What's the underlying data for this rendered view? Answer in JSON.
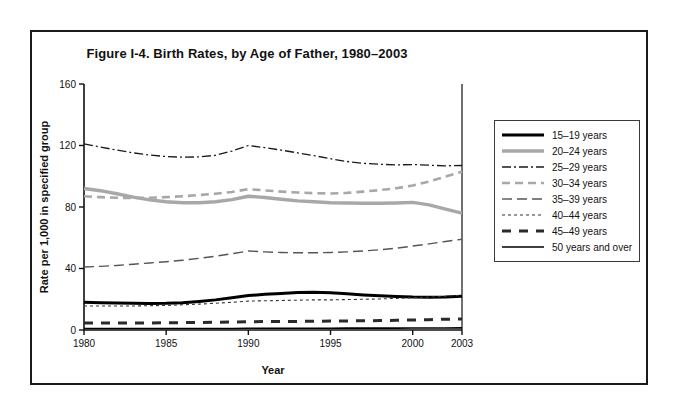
{
  "figure": {
    "title": "Figure I-4. Birth Rates, by Age of Father, 1980–2003"
  },
  "chart_data": {
    "type": "line",
    "title": "Figure I-4. Birth Rates, by Age of Father, 1980–2003",
    "xlabel": "Year",
    "ylabel": "Rate per 1,000 in specified group",
    "xlim": [
      1980,
      2003
    ],
    "ylim": [
      0,
      160
    ],
    "ytick_values": [
      0,
      40,
      80,
      120,
      160
    ],
    "ytick_labels": [
      "0",
      "40",
      "80",
      "120",
      "160"
    ],
    "xtick_values": [
      1980,
      1985,
      1990,
      1995,
      2000,
      2003
    ],
    "xtick_labels": [
      "1980",
      "1985",
      "1990",
      "1995",
      "2000",
      "2003"
    ],
    "grid": false,
    "legend_position": "right-outside",
    "x": [
      1980,
      1981,
      1982,
      1983,
      1984,
      1985,
      1986,
      1987,
      1988,
      1989,
      1990,
      1991,
      1992,
      1993,
      1994,
      1995,
      1996,
      1997,
      1998,
      1999,
      2000,
      2001,
      2002,
      2003
    ],
    "series": [
      {
        "name": "15–19 years",
        "style": "solid-thick",
        "color": "#000000",
        "values": [
          18.0,
          17.8,
          17.6,
          17.4,
          17.3,
          17.4,
          17.8,
          18.6,
          19.6,
          21.0,
          22.4,
          23.2,
          23.8,
          24.4,
          24.6,
          24.3,
          23.6,
          22.8,
          22.2,
          21.8,
          21.4,
          21.3,
          21.5,
          22.0
        ]
      },
      {
        "name": "20–24 years",
        "style": "solid-thick-gray",
        "color": "#a8a8a8",
        "values": [
          92.0,
          90.6,
          88.6,
          86.4,
          84.6,
          83.4,
          82.8,
          82.8,
          83.4,
          84.8,
          87.0,
          86.2,
          85.0,
          84.0,
          83.4,
          82.8,
          82.6,
          82.4,
          82.4,
          82.6,
          83.0,
          81.4,
          78.6,
          76.0
        ]
      },
      {
        "name": "25–29 years",
        "style": "dashdot",
        "color": "#1a1a1a",
        "values": [
          121.0,
          119.0,
          117.0,
          115.2,
          113.8,
          112.8,
          112.4,
          112.6,
          113.6,
          116.4,
          120.0,
          118.6,
          117.0,
          115.2,
          113.4,
          111.4,
          109.6,
          108.4,
          107.8,
          107.4,
          107.6,
          107.2,
          106.8,
          107.0
        ]
      },
      {
        "name": "30–34 years",
        "style": "dashed-medium-gray",
        "color": "#a8a8a8",
        "values": [
          87.0,
          86.4,
          86.0,
          85.8,
          86.0,
          86.4,
          87.0,
          87.8,
          88.6,
          89.8,
          91.6,
          90.8,
          90.0,
          89.4,
          89.0,
          88.8,
          89.2,
          90.0,
          91.0,
          92.2,
          94.0,
          96.6,
          99.8,
          103.0
        ]
      },
      {
        "name": "35–39 years",
        "style": "dashed-long",
        "color": "#555555",
        "values": [
          41.0,
          41.4,
          42.0,
          42.8,
          43.6,
          44.4,
          45.4,
          46.6,
          48.0,
          49.6,
          51.4,
          50.8,
          50.4,
          50.2,
          50.2,
          50.4,
          50.8,
          51.4,
          52.2,
          53.2,
          54.6,
          56.0,
          57.6,
          59.0
        ]
      },
      {
        "name": "40–44 years",
        "style": "dotted",
        "color": "#333333",
        "values": [
          15.6,
          15.6,
          15.6,
          15.6,
          15.8,
          16.0,
          16.4,
          16.8,
          17.4,
          18.0,
          18.8,
          19.0,
          19.2,
          19.4,
          19.6,
          19.6,
          19.8,
          20.0,
          20.2,
          20.6,
          21.0,
          21.4,
          22.0,
          22.6
        ]
      },
      {
        "name": "45–49 years",
        "style": "dashed-thick",
        "color": "#2a2a2a",
        "values": [
          4.6,
          4.6,
          4.6,
          4.6,
          4.6,
          4.7,
          4.8,
          4.9,
          5.0,
          5.2,
          5.4,
          5.5,
          5.6,
          5.6,
          5.7,
          5.8,
          5.9,
          6.0,
          6.1,
          6.3,
          6.5,
          6.7,
          7.0,
          7.2
        ]
      },
      {
        "name": "50 years and over",
        "style": "solid-thin",
        "color": "#000000",
        "values": [
          1.0,
          1.0,
          1.0,
          1.0,
          1.0,
          1.0,
          1.0,
          1.0,
          1.0,
          1.0,
          1.1,
          1.1,
          1.1,
          1.1,
          1.1,
          1.1,
          1.2,
          1.2,
          1.2,
          1.2,
          1.3,
          1.3,
          1.3,
          1.4
        ]
      }
    ]
  },
  "legend": {
    "items": [
      {
        "label": "15–19 years"
      },
      {
        "label": "20–24 years"
      },
      {
        "label": "25–29 years"
      },
      {
        "label": "30–34 years"
      },
      {
        "label": "35–39 years"
      },
      {
        "label": "40–44 years"
      },
      {
        "label": "45–49 years"
      },
      {
        "label": "50 years and over"
      }
    ]
  }
}
